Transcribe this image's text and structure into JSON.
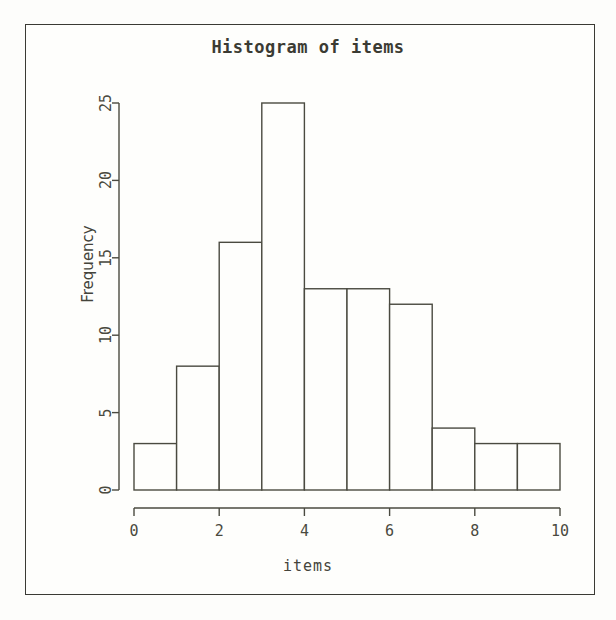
{
  "chart_data": {
    "type": "bar",
    "title": "Histogram of items",
    "xlabel": "items",
    "ylabel": "Frequency",
    "categories": [
      "0-1",
      "1-2",
      "2-3",
      "3-4",
      "4-5",
      "5-6",
      "6-7",
      "7-8",
      "8-9",
      "9-10"
    ],
    "bin_edges": [
      0,
      1,
      2,
      3,
      4,
      5,
      6,
      7,
      8,
      9,
      10
    ],
    "values": [
      3,
      8,
      16,
      25,
      13,
      13,
      12,
      4,
      3,
      3
    ],
    "xlim": [
      0,
      10
    ],
    "ylim": [
      0,
      25
    ],
    "x_ticks": [
      "0",
      "2",
      "4",
      "6",
      "8",
      "10"
    ],
    "x_tick_values": [
      0,
      2,
      4,
      6,
      8,
      10
    ],
    "y_ticks": [
      "0",
      "5",
      "10",
      "15",
      "20",
      "25"
    ],
    "y_tick_values": [
      0,
      5,
      10,
      15,
      20,
      25
    ],
    "grid": false,
    "legend": false,
    "bar_fill": "#fefefc",
    "bar_stroke": "#4a4a40",
    "axis_color": "#4a4a40",
    "background": "#fefefc",
    "frame_color": "#3a3a34"
  },
  "axes": {
    "x_title": "items",
    "y_title": "Frequency"
  },
  "title": "Histogram of items"
}
